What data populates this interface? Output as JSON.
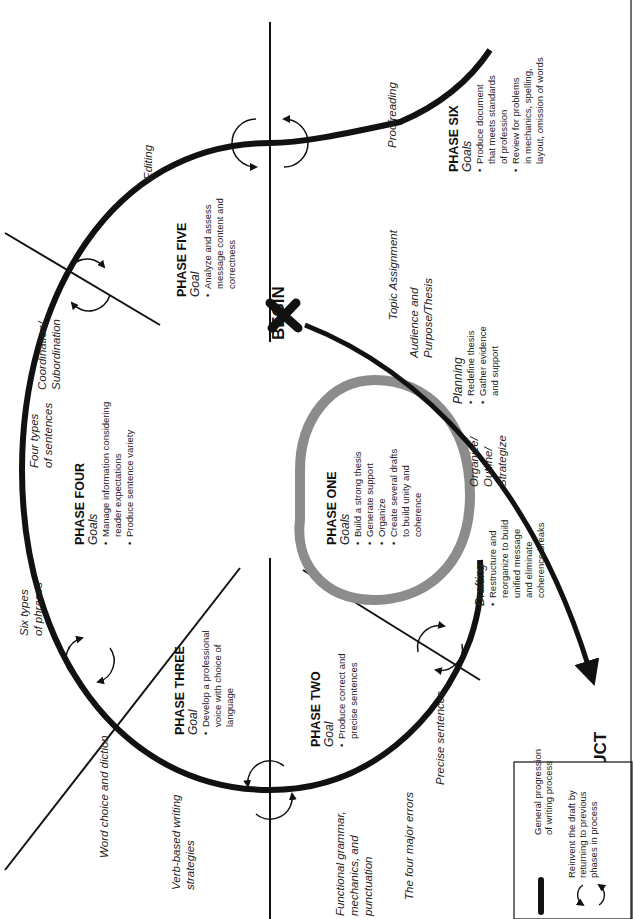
{
  "title_start": "BEGIN",
  "title_end": "FINISHED PRODUCT",
  "phases": [
    {
      "name": "PHASE ONE",
      "goal_label": "Goals",
      "bullets": [
        [
          "Build a strong thesis"
        ],
        [
          "Generate support"
        ],
        [
          "Organize"
        ],
        [
          "Create several drafts",
          "to build unity and",
          "coherence"
        ]
      ]
    },
    {
      "name": "PHASE TWO",
      "goal_label": "Goal",
      "bullets": [
        [
          "Produce correct and",
          "precise sentences"
        ]
      ]
    },
    {
      "name": "PHASE THREE",
      "goal_label": "Goal",
      "bullets": [
        [
          "Develop a professional",
          "voice with choice of",
          "language"
        ]
      ]
    },
    {
      "name": "PHASE FOUR",
      "goal_label": "Goals",
      "bullets": [
        [
          "Manage information considering",
          "reader expectations"
        ],
        [
          "Produce sentence variety"
        ]
      ]
    },
    {
      "name": "PHASE FIVE",
      "goal_label": "Goal",
      "bullets": [
        [
          "Analyze and assess",
          "message content and",
          "correctness"
        ]
      ]
    },
    {
      "name": "PHASE SIX",
      "goal_label": "Goals",
      "bullets": [
        [
          "Produce document",
          "that meets standards",
          "of profession"
        ],
        [
          "Review for problems",
          "in mechanics, spelling,",
          "layout, omission of words"
        ]
      ]
    }
  ],
  "stages": {
    "planning": {
      "label": "Planning",
      "bullets": [
        [
          "Redefine thesis"
        ],
        [
          "Gather evidence",
          "and support"
        ]
      ]
    },
    "drafting": {
      "label": "Drafting",
      "bullets": [
        [
          "Restructure and",
          "reorganize to build",
          "unified message",
          "and eliminate",
          "coherence breaks"
        ]
      ]
    }
  },
  "labels": {
    "topic": "Topic Assignment",
    "audience": [
      "Audience and",
      "Purpose/Thesis"
    ],
    "organize": [
      "Organize/",
      "Outline/",
      "Strategize"
    ],
    "proofreading": "Proofreading",
    "editing": "Editing",
    "coordination": [
      "Coordination/",
      "Subordination"
    ],
    "four_types": [
      "Four types",
      "of sentences"
    ],
    "six_types": [
      "Six types",
      "of phrases"
    ],
    "word_choice": "Word choice and diction",
    "verb_based": [
      "Verb-based writing",
      "strategies"
    ],
    "functional": [
      "Functional grammar,",
      "mechanics, and",
      "punctuation"
    ],
    "four_errors": "The four major errors",
    "precise": "Precise sentences"
  },
  "legend": {
    "items": [
      {
        "icon": "thick-line",
        "text": [
          "General progression",
          "of writing process"
        ]
      },
      {
        "icon": "cycle-arrows",
        "text": [
          "Reinvent the draft by",
          "returning to previous",
          "phases in process"
        ]
      }
    ]
  },
  "colors": {
    "line": "#111111",
    "phase_one_ring": "#8c8c8c"
  }
}
